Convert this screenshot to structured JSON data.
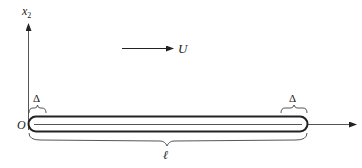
{
  "diagram": {
    "axes": {
      "vertical_label": "x",
      "vertical_subscript": "2",
      "origin_label": "O"
    },
    "flow": {
      "label": "U",
      "direction": "right"
    },
    "body": {
      "shape": "slender rounded plate",
      "left_end_label": "Δ",
      "right_end_label": "Δ",
      "length_label": "ℓ"
    },
    "colors": {
      "stroke": "#222222",
      "axis": "#555555",
      "background": "#ffffff"
    }
  }
}
